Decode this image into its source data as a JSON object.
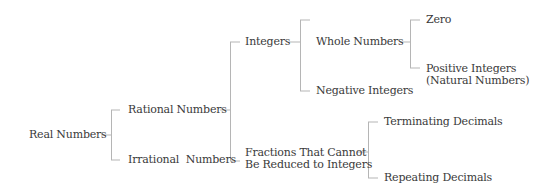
{
  "diagram": {
    "type": "tree",
    "nodes": {
      "real": "Real Numbers",
      "rational": "Rational Numbers",
      "irrational": "Irrational  Numbers",
      "integers": "Integers",
      "fractions_line1": "Fractions That Cannot",
      "fractions_line2": "Be Reduced to Integers",
      "whole": "Whole Numbers",
      "negative": "Negative Integers",
      "zero": "Zero",
      "positive_line1": "Positive Integers",
      "positive_line2": "(Natural Numbers)",
      "terminating": "Terminating Decimals",
      "repeating": "Repeating Decimals"
    },
    "edges": [
      [
        "Real Numbers",
        "Rational Numbers"
      ],
      [
        "Real Numbers",
        "Irrational Numbers"
      ],
      [
        "Rational Numbers",
        "Integers"
      ],
      [
        "Rational Numbers",
        "Fractions That Cannot Be Reduced to Integers"
      ],
      [
        "Integers",
        "Whole Numbers"
      ],
      [
        "Integers",
        "Negative Integers"
      ],
      [
        "Whole Numbers",
        "Zero"
      ],
      [
        "Whole Numbers",
        "Positive Integers (Natural Numbers)"
      ],
      [
        "Fractions That Cannot Be Reduced to Integers",
        "Terminating Decimals"
      ],
      [
        "Fractions That Cannot Be Reduced to Integers",
        "Repeating Decimals"
      ]
    ],
    "line_color": "#b5b5b5",
    "text_color": "#3a3a3a"
  }
}
